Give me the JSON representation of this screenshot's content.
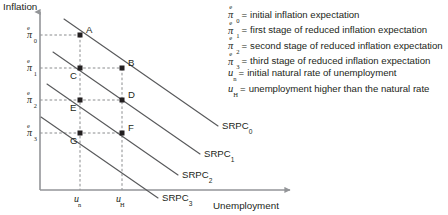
{
  "chart_data": {
    "type": "line",
    "title": "",
    "xlabel": "Unemployment",
    "ylabel": "Inflation",
    "grid": true,
    "legend_position": "right",
    "x_ticks": [
      {
        "label": "u_n",
        "symbol": "u",
        "sub": "n",
        "px": 80
      },
      {
        "label": "u_H",
        "symbol": "u",
        "sub": "H",
        "px": 122
      }
    ],
    "y_ticks": [
      {
        "label": "pi_0^e",
        "symbol": "π",
        "sub": "0",
        "sup": "e",
        "px": 35
      },
      {
        "label": "pi_1^e",
        "symbol": "π",
        "sub": "1",
        "sup": "e",
        "px": 68
      },
      {
        "label": "pi_2^e",
        "symbol": "π",
        "sub": "2",
        "sup": "e",
        "px": 100
      },
      {
        "label": "pi_3^e",
        "symbol": "π",
        "sub": "3",
        "sup": "e",
        "px": 133
      }
    ],
    "series": [
      {
        "name": "SRPC0",
        "label": "SRPC",
        "sub": "0",
        "x1": 64,
        "y1": 19,
        "x2": 218,
        "y2": 126
      },
      {
        "name": "SRPC1",
        "label": "SRPC",
        "sub": "1",
        "x1": 53,
        "y1": 52,
        "x2": 200,
        "y2": 154
      },
      {
        "name": "SRPC2",
        "label": "SRPC",
        "sub": "2",
        "x1": 47,
        "y1": 84,
        "x2": 178,
        "y2": 175
      },
      {
        "name": "SRPC3",
        "label": "SRPC",
        "sub": "3",
        "x1": 41,
        "y1": 117,
        "x2": 158,
        "y2": 198
      }
    ],
    "points": [
      {
        "name": "A",
        "label": "A",
        "x": 80,
        "y": 35,
        "lx": 86,
        "ly": 24,
        "curve": "SRPC0"
      },
      {
        "name": "B",
        "label": "B",
        "x": 122,
        "y": 68,
        "lx": 128,
        "ly": 57,
        "curve": "SRPC0"
      },
      {
        "name": "C",
        "label": "C",
        "x": 80,
        "y": 68,
        "lx": 70,
        "ly": 70,
        "curve": "SRPC1"
      },
      {
        "name": "D",
        "label": "D",
        "x": 122,
        "y": 100,
        "lx": 128,
        "ly": 89,
        "curve": "SRPC1"
      },
      {
        "name": "E",
        "label": "E",
        "x": 80,
        "y": 100,
        "lx": 70,
        "ly": 102,
        "curve": "SRPC2"
      },
      {
        "name": "F",
        "label": "F",
        "x": 122,
        "y": 133,
        "lx": 128,
        "ly": 122,
        "curve": "SRPC2"
      },
      {
        "name": "G",
        "label": "G",
        "x": 80,
        "y": 133,
        "lx": 70,
        "ly": 135,
        "curve": "SRPC3"
      }
    ],
    "axes": {
      "origin_x": 40,
      "origin_y": 190,
      "x_end": 290,
      "y_top": 12
    },
    "colors": {
      "curve": "#58595b",
      "axis": "#939598",
      "point": "#231f20",
      "grid": "#6d6e71",
      "text": "#231f20"
    }
  },
  "legend": {
    "items": [
      {
        "symbol": "π",
        "sub": "0",
        "sup": "e",
        "eq": "=",
        "text": "initial inflation expectation"
      },
      {
        "symbol": "π",
        "sub": "1",
        "sup": "e",
        "eq": "=",
        "text": "first stage of reduced inflation expectation"
      },
      {
        "symbol": "π",
        "sub": "2",
        "sup": "e",
        "eq": "=",
        "text": "second stage of reduced inflation expectation"
      },
      {
        "symbol": "π",
        "sub": "3",
        "sup": "e",
        "eq": "=",
        "text": "third stage of reduced inflation expectation"
      },
      {
        "symbol": "u",
        "sub": "n",
        "sup": "",
        "eq": "=",
        "text": "initial natural rate of unemployment"
      },
      {
        "symbol": "u",
        "sub": "H",
        "sup": "",
        "eq": "=",
        "text": "unemployment higher than the natural rate"
      }
    ]
  }
}
